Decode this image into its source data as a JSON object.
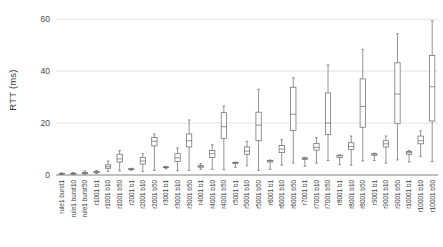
{
  "chart_data": {
    "type": "box",
    "title": "",
    "xlabel": "",
    "ylabel": "RTT (ms)",
    "ylim": [
      0,
      62
    ],
    "yticks": [
      0,
      20,
      40,
      60
    ],
    "ytick_labels": [
      "0",
      "20",
      "40",
      "60"
    ],
    "grid": true,
    "legend": false,
    "categories": [
      "rule1 burst1",
      "rule1 burst10",
      "rule1 burst50",
      "r1001 b1",
      "r1001 b10",
      "r1001 b50",
      "r2001 b1",
      "r2001 b10",
      "r2001 b50",
      "r3001 b1",
      "r3001 b10",
      "r3001 b50",
      "r4001 b1",
      "r4001 b10",
      "r4001 b50",
      "r5001 b1",
      "r5001 b10",
      "r5001 b50",
      "r6001 b1",
      "r6001 b10",
      "r6001 b50",
      "r7001 b1",
      "r7001 b10",
      "r7001 b50",
      "r8001 b1",
      "r8001 b10",
      "r8001 b50",
      "r9001 b1",
      "r9001 b10",
      "r9001 b50",
      "r10001 b1",
      "r10001 b10",
      "r10001 b50"
    ],
    "series_name": "RTT distribution",
    "boxes": [
      {
        "category": "rule1 burst1",
        "min": 0.3,
        "q1": 0.4,
        "median": 0.5,
        "q3": 0.6,
        "max": 0.8
      },
      {
        "category": "rule1 burst10",
        "min": 0.3,
        "q1": 0.4,
        "median": 0.5,
        "q3": 0.7,
        "max": 0.9
      },
      {
        "category": "rule1 burst50",
        "min": 0.3,
        "q1": 0.5,
        "median": 0.7,
        "q3": 1.0,
        "max": 1.6
      },
      {
        "category": "r1001 b1",
        "min": 0.6,
        "q1": 0.9,
        "median": 1.1,
        "q3": 1.3,
        "max": 1.8
      },
      {
        "category": "r1001 b10",
        "min": 1.4,
        "q1": 2.6,
        "median": 3.2,
        "q3": 3.9,
        "max": 5.4
      },
      {
        "category": "r1001 b50",
        "min": 1.6,
        "q1": 5.0,
        "median": 6.2,
        "q3": 8.0,
        "max": 9.4
      },
      {
        "category": "r2001 b1",
        "min": 1.8,
        "q1": 2.2,
        "median": 2.3,
        "q3": 2.4,
        "max": 2.6
      },
      {
        "category": "r2001 b10",
        "min": 1.4,
        "q1": 4.2,
        "median": 5.4,
        "q3": 6.8,
        "max": 8.2
      },
      {
        "category": "r2001 b50",
        "min": 1.8,
        "q1": 11.2,
        "median": 13.0,
        "q3": 14.4,
        "max": 15.8
      },
      {
        "category": "r3001 b1",
        "min": 2.4,
        "q1": 2.8,
        "median": 3.0,
        "q3": 3.1,
        "max": 3.3
      },
      {
        "category": "r3001 b10",
        "min": 1.6,
        "q1": 5.2,
        "median": 6.6,
        "q3": 8.2,
        "max": 10.4
      },
      {
        "category": "r3001 b50",
        "min": 1.8,
        "q1": 10.8,
        "median": 13.2,
        "q3": 15.8,
        "max": 21.2
      },
      {
        "category": "r4001 b1",
        "min": 2.2,
        "q1": 3.0,
        "median": 3.4,
        "q3": 3.6,
        "max": 4.4
      },
      {
        "category": "r4001 b10",
        "min": 2.2,
        "q1": 6.8,
        "median": 8.2,
        "q3": 9.4,
        "max": 11.6
      },
      {
        "category": "r4001 b50",
        "min": 2.0,
        "q1": 14.0,
        "median": 18.6,
        "q3": 24.0,
        "max": 26.6
      },
      {
        "category": "r5001 b1",
        "min": 3.0,
        "q1": 4.4,
        "median": 4.7,
        "q3": 4.8,
        "max": 5.0
      },
      {
        "category": "r5001 b10",
        "min": 3.6,
        "q1": 8.0,
        "median": 9.2,
        "q3": 10.8,
        "max": 13.0
      },
      {
        "category": "r5001 b50",
        "min": 1.8,
        "q1": 13.2,
        "median": 19.2,
        "q3": 24.2,
        "max": 33.0
      },
      {
        "category": "r6001 b1",
        "min": 2.2,
        "q1": 5.0,
        "median": 5.4,
        "q3": 5.6,
        "max": 5.8
      },
      {
        "category": "r6001 b10",
        "min": 3.8,
        "q1": 8.6,
        "median": 10.0,
        "q3": 11.4,
        "max": 13.6
      },
      {
        "category": "r6001 b50",
        "min": 4.6,
        "q1": 17.2,
        "median": 23.4,
        "q3": 33.8,
        "max": 37.4
      },
      {
        "category": "r7001 b1",
        "min": 3.4,
        "q1": 6.0,
        "median": 6.4,
        "q3": 6.6,
        "max": 6.8
      },
      {
        "category": "r7001 b10",
        "min": 4.6,
        "q1": 9.6,
        "median": 10.6,
        "q3": 12.2,
        "max": 14.4
      },
      {
        "category": "r7001 b50",
        "min": 5.6,
        "q1": 15.6,
        "median": 20.0,
        "q3": 31.6,
        "max": 42.4
      },
      {
        "category": "r8001 b1",
        "min": 4.0,
        "q1": 6.8,
        "median": 7.4,
        "q3": 7.6,
        "max": 7.8
      },
      {
        "category": "r8001 b10",
        "min": 3.8,
        "q1": 9.8,
        "median": 11.0,
        "q3": 12.4,
        "max": 15.0
      },
      {
        "category": "r8001 b50",
        "min": 5.4,
        "q1": 18.4,
        "median": 26.4,
        "q3": 37.0,
        "max": 48.4
      },
      {
        "category": "r9001 b1",
        "min": 5.6,
        "q1": 7.6,
        "median": 8.0,
        "q3": 8.2,
        "max": 8.4
      },
      {
        "category": "r9001 b10",
        "min": 4.6,
        "q1": 10.8,
        "median": 12.0,
        "q3": 13.2,
        "max": 15.0
      },
      {
        "category": "r9001 b50",
        "min": 5.8,
        "q1": 19.8,
        "median": 31.2,
        "q3": 43.2,
        "max": 54.4
      },
      {
        "category": "r10001 b1",
        "min": 5.0,
        "q1": 8.0,
        "median": 8.6,
        "q3": 9.0,
        "max": 9.4
      },
      {
        "category": "r10001 b10",
        "min": 7.2,
        "q1": 12.0,
        "median": 13.2,
        "q3": 15.0,
        "max": 17.0
      },
      {
        "category": "r10001 b50",
        "min": 5.2,
        "q1": 20.8,
        "median": 34.0,
        "q3": 46.0,
        "max": 59.4
      }
    ],
    "colors": {
      "box_fill": "#ffffff",
      "box_stroke": "#666666",
      "gridline": "#d9d9d9",
      "axis": "#808080",
      "text": "#3a3a3a"
    }
  }
}
